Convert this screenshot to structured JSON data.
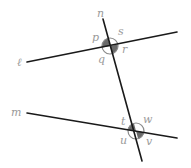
{
  "diagram": {
    "type": "parallel-lines-transversal",
    "lines": {
      "l": {
        "label": "ℓ",
        "x1": 27,
        "y1": 62,
        "x2": 177,
        "y2": 32
      },
      "m": {
        "label": "m",
        "x1": 27,
        "y1": 113,
        "x2": 177,
        "y2": 138
      },
      "n": {
        "label": "n",
        "x1": 103,
        "y1": 19,
        "x2": 142,
        "y2": 161
      }
    },
    "intersections": [
      {
        "name": "top",
        "cx": 110,
        "cy": 46,
        "r": 8,
        "angles": {
          "p": "p",
          "s": "s",
          "q": "q",
          "r": "r"
        },
        "shaded": [
          "p",
          "r"
        ]
      },
      {
        "name": "bottom",
        "cx": 136,
        "cy": 131,
        "r": 8,
        "angles": {
          "t": "t",
          "w": "w",
          "u": "u",
          "v": "v"
        },
        "shaded": [
          "t",
          "v"
        ]
      }
    ],
    "labels": {
      "n": "n",
      "l": "ℓ",
      "m": "m",
      "p": "p",
      "s": "s",
      "q": "q",
      "r": "r",
      "t": "t",
      "w": "w",
      "u": "u",
      "v": "v"
    },
    "colors": {
      "line": "#1a1a1a",
      "shade": "#6a6a6a",
      "label": "#9a9a9a",
      "background": "#ffffff"
    }
  }
}
